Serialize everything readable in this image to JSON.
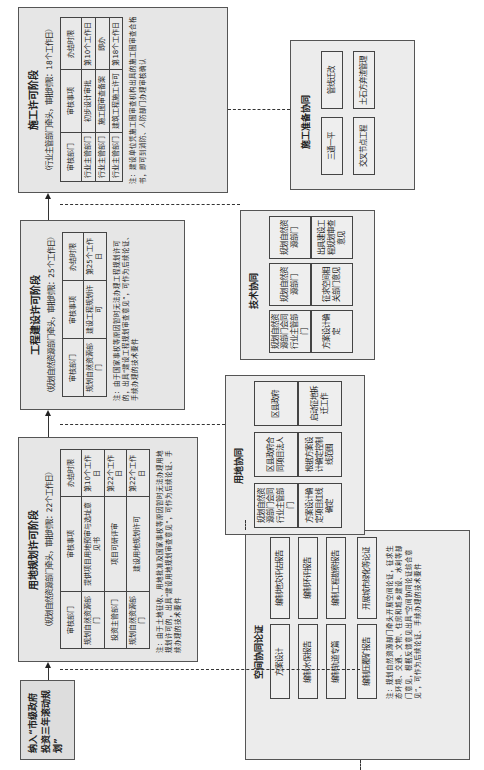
{
  "start": {
    "label": "纳入“市级政府投资三年滚动规划”"
  },
  "land_use_stage": {
    "title": "用地规划许可阶段",
    "subtitle": "（规划自然资源部门牵头，审批时限：22个工作日）",
    "headers": [
      "审核部门",
      "审核事项",
      "办结时限"
    ],
    "rows": [
      [
        "规划自然资源部门",
        "提供项目用地预审与选址意见书",
        "第10个工作日"
      ],
      [
        "投资主管部门",
        "项目可研评审",
        "第22个工作日"
      ],
      [
        "规划自然资源部门",
        "建设用地规划许可",
        "第22个工作日"
      ]
    ],
    "note": "注：由于土地征收、用地批准及国家事权等原因暂时无法办理用地规划许可的，出具“建设用地规划审查意见”，可作为后续论证、手续办理的技术要件"
  },
  "engineering_stage": {
    "title": "工程建设许可阶段",
    "subtitle": "（规划自然资源部门牵头，审批时限：25个工作日）",
    "headers": [
      "审核部门",
      "审核事项",
      "办结时限"
    ],
    "rows": [
      [
        "规划自然资源部门",
        "建设工程规划许可",
        "第25个工作日"
      ]
    ],
    "note": "注：由于国家事权等原因暂时无法办理工程规划许可的，出具“建设工程规划审查意见”，可作为后续论证、手续办理的技术要件"
  },
  "construction_stage": {
    "title": "施工许可阶段",
    "subtitle": "（行业主管部门牵头，审批时限：18个工作日）",
    "headers": [
      "审核部门",
      "审核事项",
      "办结时限"
    ],
    "rows": [
      [
        "行业主管部门",
        "初步设计审批",
        "第10个工作日"
      ],
      [
        "行业主管部门",
        "施工图审查备案",
        "即办"
      ],
      [
        "行业主管部门",
        "建筑工程施工许可",
        "第18个工作日"
      ]
    ],
    "note": "注：建设单位凭施工图审查机构出具的施工图审查合格书，即可到消防、人防部门办理审核确认"
  },
  "prep_coordination": {
    "title": "施工准备协同",
    "items": [
      "三通一平",
      "管线迁改",
      "交叉节点工程",
      "土石方弃渣管理"
    ]
  },
  "tech_coordination": {
    "title": "技术协同",
    "steps": [
      {
        "dept": "规划自然资源部门会同行业主管部门",
        "task": "方案设计确定"
      },
      {
        "dept": "规划自然资源部门",
        "task": "征求空间相关部门意见"
      },
      {
        "dept": "规划自然资源部门",
        "task": "出具建设工程规划审查意见"
      }
    ]
  },
  "land_coordination": {
    "title": "用地协同",
    "steps": [
      {
        "dept": "规划自然资源部门会同行业主管部门",
        "task": "方案设计确定项目红线确定"
      },
      {
        "dept": "区县政府合同项目法人",
        "task": "根据方案设计确定控制线范围"
      },
      {
        "dept": "区县政府",
        "task": "启动征地拆迁工作"
      }
    ]
  },
  "spatial_coordination": {
    "title": "空间协同论证",
    "col_left": [
      "方案设计",
      "编制水保报告",
      "编制轨道专篇",
      "编制压覆矿报告"
    ],
    "col_right": [
      "编制地灾评估报告",
      "编制环评报告",
      "编制工程勘察报告",
      "开展城市绿化等论证"
    ],
    "note": "注：规划自然资源部门牵头开展空间论证，征求生态环境、交通、文物、住房和城乡建设、水利等部门意见，根据反馈意见出具“空间协同论证综合意见”，可作为后续论证、手续办理的技术要件"
  }
}
